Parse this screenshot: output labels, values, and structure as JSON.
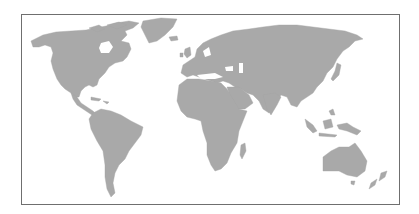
{
  "map": {
    "type": "world-map",
    "style": "greyscale silhouette",
    "land_color": "#a9a9a9",
    "water_color": "#ffffff",
    "border_color": "#6f6f6f",
    "regions": [
      {
        "name": "north-america"
      },
      {
        "name": "greenland"
      },
      {
        "name": "central-america"
      },
      {
        "name": "caribbean"
      },
      {
        "name": "south-america"
      },
      {
        "name": "europe"
      },
      {
        "name": "africa"
      },
      {
        "name": "madagascar"
      },
      {
        "name": "asia"
      },
      {
        "name": "arabian-peninsula"
      },
      {
        "name": "india"
      },
      {
        "name": "japan"
      },
      {
        "name": "southeast-asia"
      },
      {
        "name": "australia"
      },
      {
        "name": "new-zealand"
      },
      {
        "name": "british-isles"
      },
      {
        "name": "iceland"
      }
    ]
  }
}
